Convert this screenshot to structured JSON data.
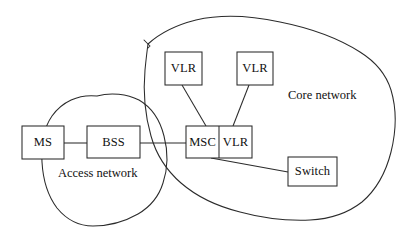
{
  "diagram": {
    "style": {
      "background": "#ffffff",
      "stroke_color": "#2b2b2b",
      "text_color": "#111111"
    },
    "regions": [
      {
        "id": "access-network",
        "label": "Access network",
        "label_x": 58,
        "label_y": 167,
        "outline": "M 97 96 C 78 94 62 102 52 116 C 43 129 41 146 42 162 C 43 180 48 196 57 208 C 66 219 79 226 93 226 C 108 226 124 222 138 214 C 150 207 159 196 163 183 C 168 168 168 151 164 136 C 160 120 151 107 139 100 C 127 94 111 92 97 96 Z"
      },
      {
        "id": "core-network",
        "label": "Core network",
        "label_x": 288,
        "label_y": 89,
        "outline": "M 148 44 C 160 33 176 25 196 20 C 222 14 252 16 280 22 C 310 28 338 38 360 52 C 376 62 386 74 391 90 C 397 110 396 132 391 152 C 386 172 376 190 362 202 C 348 213 330 219 310 220 C 286 221 262 218 240 212 C 216 206 196 196 181 183 C 166 170 156 154 151 136 C 145 115 143 92 145 70 C 146 60 147 51 148 44 Z",
        "notch": "M 144 40 L 150 46 L 148 48"
      }
    ],
    "nodes": [
      {
        "id": "ms",
        "label": "MS",
        "x": 22,
        "y": 126,
        "width": 42,
        "height": 33,
        "split": false
      },
      {
        "id": "bss",
        "label": "BSS",
        "x": 87,
        "y": 126,
        "width": 53,
        "height": 32,
        "split": false
      },
      {
        "id": "msc-vlr",
        "label": "MSC",
        "label2": "VLR",
        "x": 186,
        "y": 126,
        "width": 66,
        "height": 32,
        "split": true,
        "divider_offset": 33
      },
      {
        "id": "vlr-left",
        "label": "VLR",
        "x": 165,
        "y": 52,
        "width": 37,
        "height": 33,
        "split": false
      },
      {
        "id": "vlr-right",
        "label": "VLR",
        "x": 237,
        "y": 52,
        "width": 36,
        "height": 33,
        "split": false
      },
      {
        "id": "switch",
        "label": "Switch",
        "x": 288,
        "y": 157,
        "width": 49,
        "height": 29,
        "split": false
      }
    ],
    "links": [
      {
        "id": "ms-to-bss",
        "from": "ms",
        "to": "bss",
        "x1": 64,
        "y1": 143,
        "x2": 87,
        "y2": 143
      },
      {
        "id": "bss-to-msc",
        "from": "bss",
        "to": "msc-vlr",
        "x1": 140,
        "y1": 143,
        "x2": 186,
        "y2": 143
      },
      {
        "id": "vlr-left-to-msc",
        "from": "vlr-left",
        "to": "msc-vlr",
        "x1": 182,
        "y1": 85,
        "x2": 206,
        "y2": 126
      },
      {
        "id": "vlr-right-to-vlr",
        "from": "vlr-right",
        "to": "msc-vlr",
        "x1": 249,
        "y1": 85,
        "x2": 233,
        "y2": 126
      },
      {
        "id": "msc-to-switch",
        "from": "msc-vlr",
        "to": "switch",
        "x1": 211,
        "y1": 158,
        "x2": 288,
        "y2": 172
      }
    ]
  }
}
